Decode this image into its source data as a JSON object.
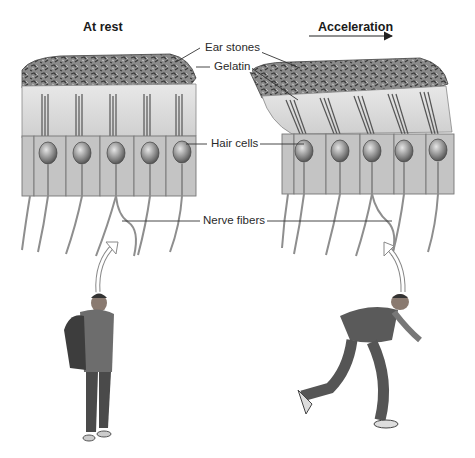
{
  "diagram": {
    "panels": [
      {
        "id": "rest",
        "heading": "At rest",
        "arrow": false
      },
      {
        "id": "acceleration",
        "heading": "Acceleration",
        "arrow": true
      }
    ],
    "labels": {
      "ear_stones": "Ear stones",
      "gelatin": "Gelatin",
      "hair_cells": "Hair cells",
      "nerve_fibers": "Nerve fibers"
    },
    "figures": {
      "rest": "standing-person-with-backpack",
      "acceleration": "running-person-with-backpack"
    },
    "colors": {
      "ink": "#222222",
      "stone": "#6e6e6e",
      "gelatin": "#d9d9d9",
      "cell": "#bdbdbd",
      "nucleus": "#7a7a7a",
      "fiber": "#9a9a9a",
      "background": "#ffffff"
    }
  }
}
